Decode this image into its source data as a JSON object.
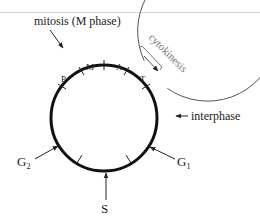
{
  "diagram": {
    "labels": {
      "mitosis": "mitosis (M phase)",
      "cytokinesis": "cytokinesis",
      "interphase": "interphase",
      "g1": "G",
      "g1_sub": "1",
      "g2": "G",
      "g2_sub": "2",
      "s": "S",
      "prophase": "P",
      "metaphase": "M",
      "anaphase": "A",
      "telophase": "T"
    },
    "colors": {
      "inner_ring": "#111111",
      "outer_ring": "#555555",
      "cytokinesis_text": "#777777",
      "text": "#222222"
    }
  }
}
